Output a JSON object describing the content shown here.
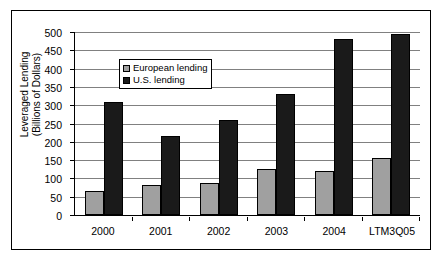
{
  "chart_data": {
    "type": "bar",
    "title": "",
    "xlabel": "",
    "ylabel": "Leveraged Lending\n(Billions of Dollars)",
    "ylim": [
      0,
      500
    ],
    "yticks": [
      0,
      50,
      100,
      150,
      200,
      250,
      300,
      350,
      400,
      450,
      500
    ],
    "grid": true,
    "legend_position": "upper-left-inside",
    "categories": [
      "2000",
      "2001",
      "2002",
      "2003",
      "2004",
      "LTM3Q05"
    ],
    "series": [
      {
        "name": "European lending",
        "color": "#a0a0a0",
        "values": [
          65,
          83,
          88,
          125,
          120,
          155
        ]
      },
      {
        "name": "U.S. lending",
        "color": "#1a1a1a",
        "values": [
          310,
          215,
          260,
          330,
          480,
          495
        ]
      }
    ]
  },
  "legend": {
    "items": [
      {
        "label": "European lending",
        "swatch": "eu"
      },
      {
        "label": "U.S. lending",
        "swatch": "us"
      }
    ]
  },
  "colors": {
    "european": "#a0a0a0",
    "us": "#1a1a1a",
    "gridline": "#808080",
    "axis": "#000000",
    "background": "#ffffff"
  }
}
